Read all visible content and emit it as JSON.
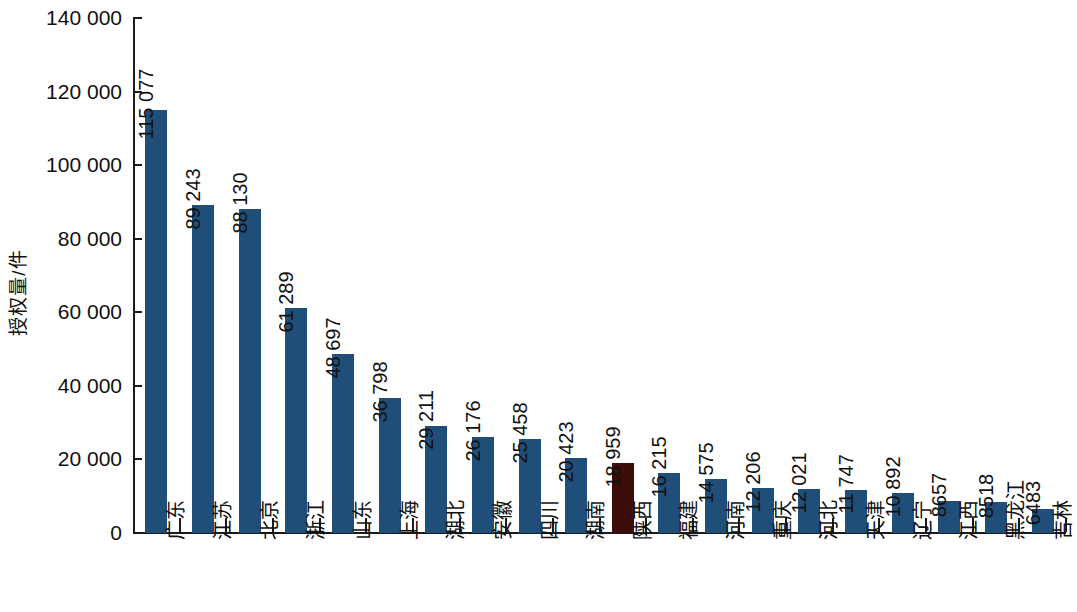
{
  "chart_data": {
    "type": "bar",
    "title": "",
    "subtitle": "",
    "xlabel": "",
    "ylabel": "授权量/件",
    "ylim": [
      0,
      140000
    ],
    "ytick_step": 20000,
    "ytick_labels": [
      "0",
      "20 000",
      "40 000",
      "60 000",
      "80 000",
      "100 000",
      "120 000",
      "140 000"
    ],
    "ytick_values": [
      0,
      20000,
      40000,
      60000,
      80000,
      100000,
      120000,
      140000
    ],
    "grid": false,
    "legend": "none",
    "categories": [
      "广东",
      "江苏",
      "北京",
      "浙江",
      "山东",
      "上海",
      "湖北",
      "安徽",
      "四川",
      "湖南",
      "陕西",
      "福建",
      "河南",
      "重庆",
      "河北",
      "天津",
      "辽宁",
      "江西",
      "黑龙江",
      "吉林"
    ],
    "values": [
      115077,
      89243,
      88130,
      61289,
      48697,
      36798,
      29211,
      26176,
      25458,
      20423,
      18959,
      16215,
      14575,
      12206,
      12021,
      11747,
      10892,
      8657,
      8518,
      6483
    ],
    "value_labels": [
      "115 077",
      "89 243",
      "88 130",
      "61 289",
      "48 697",
      "36 798",
      "29 211",
      "26 176",
      "25 458",
      "20 423",
      "18 959",
      "16 215",
      "14 575",
      "12 206",
      "12 021",
      "11 747",
      "10 892",
      "8657",
      "8518",
      "6483"
    ],
    "highlight_index": 10,
    "colors": {
      "bar": "#1F4E79",
      "highlight_bar": "#3D0D0A",
      "axis": "#1a1a1a",
      "text": "#111111",
      "background": "#ffffff"
    }
  }
}
